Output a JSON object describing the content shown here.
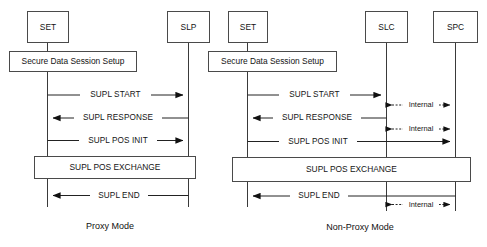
{
  "figure": {
    "background_color": "#ffffff",
    "line_color": "#222222",
    "box_stroke_color": "#4a4a4a"
  },
  "diagrams": [
    {
      "id": "proxy-mode",
      "caption": "Proxy Mode",
      "actors": [
        {
          "id": "set",
          "label": "SET"
        },
        {
          "id": "slp",
          "label": "SLP"
        }
      ],
      "spanning_bars": [
        {
          "id": "secure-data-session-setup",
          "label": "Secure Data Session Setup"
        },
        {
          "id": "supl-pos-exchange",
          "label": "SUPL POS EXCHANGE"
        }
      ],
      "messages": [
        {
          "id": "supl-start",
          "label": "SUPL START",
          "from": "SET",
          "to": "SLP",
          "direction": "right",
          "style": "solid"
        },
        {
          "id": "supl-response",
          "label": "SUPL RESPONSE",
          "from": "SLP",
          "to": "SET",
          "direction": "left",
          "style": "solid"
        },
        {
          "id": "supl-pos-init",
          "label": "SUPL POS INIT",
          "from": "SET",
          "to": "SLP",
          "direction": "right",
          "style": "solid"
        },
        {
          "id": "supl-end",
          "label": "SUPL END",
          "from": "SLP",
          "to": "SET",
          "direction": "left",
          "style": "solid"
        }
      ]
    },
    {
      "id": "non-proxy-mode",
      "caption": "Non-Proxy Mode",
      "actors": [
        {
          "id": "set",
          "label": "SET"
        },
        {
          "id": "slc",
          "label": "SLC"
        },
        {
          "id": "spc",
          "label": "SPC"
        }
      ],
      "spanning_bars": [
        {
          "id": "secure-data-session-setup",
          "label": "Secure Data Session Setup"
        },
        {
          "id": "supl-pos-exchange",
          "label": "SUPL POS EXCHANGE"
        }
      ],
      "messages": [
        {
          "id": "supl-start",
          "label": "SUPL START",
          "from": "SET",
          "to": "SLC",
          "direction": "right",
          "style": "solid"
        },
        {
          "id": "internal-1",
          "label": "Internal",
          "from": "SLC",
          "to": "SPC",
          "direction": "both",
          "style": "dashed"
        },
        {
          "id": "supl-response",
          "label": "SUPL RESPONSE",
          "from": "SLC",
          "to": "SET",
          "direction": "left",
          "style": "solid"
        },
        {
          "id": "internal-2",
          "label": "Internal",
          "from": "SLC",
          "to": "SPC",
          "direction": "both",
          "style": "dashed"
        },
        {
          "id": "supl-pos-init",
          "label": "SUPL POS INIT",
          "from": "SET",
          "to": "SPC",
          "direction": "right",
          "style": "solid"
        },
        {
          "id": "supl-end",
          "label": "SUPL END",
          "from": "SPC",
          "to": "SET",
          "direction": "left",
          "style": "solid"
        },
        {
          "id": "internal-3",
          "label": "Internal",
          "from": "SLC",
          "to": "SPC",
          "direction": "both",
          "style": "dashed"
        }
      ]
    }
  ]
}
